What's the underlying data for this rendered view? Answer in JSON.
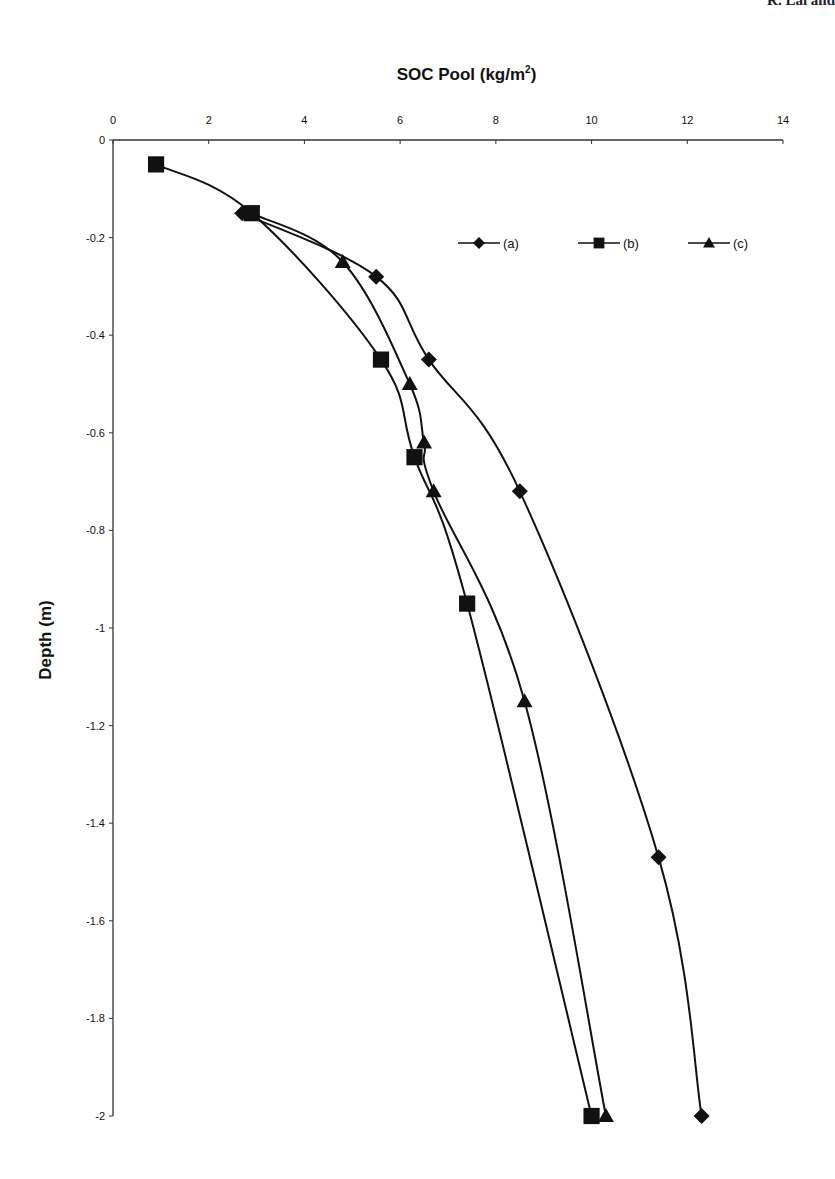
{
  "header": {
    "partial_text": "R. Lal and"
  },
  "chart_data": {
    "type": "line",
    "title_main": "SOC Pool (kg/m",
    "title_sup": "2",
    "title_end": ")",
    "xlabel": "SOC Pool (kg/m²)",
    "ylabel": "Depth (m)",
    "xlim": [
      0,
      14
    ],
    "ylim": [
      -2,
      0
    ],
    "x_ticks": [
      "0",
      "2",
      "4",
      "6",
      "8",
      "10",
      "12",
      "14"
    ],
    "y_ticks": [
      "0",
      "-0.2",
      "-0.4",
      "-0.6",
      "-0.8",
      "-1",
      "-1.2",
      "-1.4",
      "-1.6",
      "-1.8",
      "-2"
    ],
    "x_axis_position": "top",
    "grid": false,
    "legend_position": "upper right, inside",
    "series": [
      {
        "name": "(a)",
        "marker": "diamond",
        "x": [
          2.7,
          5.5,
          6.6,
          8.5,
          11.4,
          12.3
        ],
        "y": [
          -0.15,
          -0.28,
          -0.45,
          -0.72,
          -1.47,
          -2.0
        ]
      },
      {
        "name": "(b)",
        "marker": "square",
        "x": [
          0.9,
          2.9,
          5.6,
          6.3,
          7.4,
          10.0
        ],
        "y": [
          -0.05,
          -0.15,
          -0.45,
          -0.65,
          -0.95,
          -2.0
        ]
      },
      {
        "name": "(c)",
        "marker": "triangle",
        "x": [
          2.9,
          4.8,
          6.2,
          6.5,
          6.7,
          8.6,
          10.3
        ],
        "y": [
          -0.15,
          -0.25,
          -0.5,
          -0.62,
          -0.72,
          -1.15,
          -2.0
        ]
      }
    ]
  }
}
